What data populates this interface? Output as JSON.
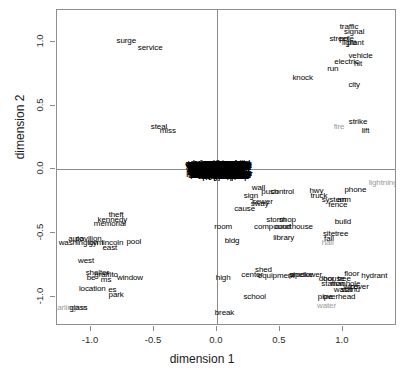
{
  "chart_data": {
    "type": "scatter",
    "title": "",
    "xlabel": "dimension 1",
    "ylabel": "dimension 2",
    "xlim": [
      -1.27,
      1.43
    ],
    "ylim": [
      -1.23,
      1.25
    ],
    "xticks": [
      -1.0,
      -0.5,
      0.0,
      0.5,
      1.0
    ],
    "xticklabels": [
      "-1.0",
      "-0.5",
      "0.0",
      "0.5",
      "1.0"
    ],
    "yticks": [
      1.0,
      0.5,
      0.0,
      -0.5,
      -1.0
    ],
    "yticklabels": [
      "1.0",
      "0.5",
      "0.0",
      "-0.5",
      "-1.0"
    ],
    "grid": false,
    "legend": false,
    "marker": "text-label",
    "points": [
      {
        "label": "surge",
        "x": -0.72,
        "y": 1.01,
        "color": "black"
      },
      {
        "label": "service",
        "x": -0.53,
        "y": 0.95,
        "color": "black"
      },
      {
        "label": "steal",
        "x": -0.46,
        "y": 0.33,
        "color": "black"
      },
      {
        "label": "miss",
        "x": -0.39,
        "y": 0.3,
        "color": "black"
      },
      {
        "label": "traffic",
        "x": 1.05,
        "y": 1.12,
        "color": "black"
      },
      {
        "label": "signal",
        "x": 1.09,
        "y": 1.08,
        "color": "black"
      },
      {
        "label": "street",
        "x": 0.97,
        "y": 1.02,
        "color": "black"
      },
      {
        "label": "pole",
        "x": 1.03,
        "y": 1.02,
        "color": "black"
      },
      {
        "label": "light",
        "x": 1.05,
        "y": 0.99,
        "color": "black"
      },
      {
        "label": "plant",
        "x": 1.1,
        "y": 0.99,
        "color": "black"
      },
      {
        "label": "vehicle",
        "x": 1.14,
        "y": 0.89,
        "color": "black"
      },
      {
        "label": "electric",
        "x": 1.03,
        "y": 0.84,
        "color": "black"
      },
      {
        "label": "hit",
        "x": 1.12,
        "y": 0.83,
        "color": "black"
      },
      {
        "label": "run",
        "x": 0.92,
        "y": 0.79,
        "color": "black"
      },
      {
        "label": "knock",
        "x": 0.68,
        "y": 0.72,
        "color": "black"
      },
      {
        "label": "city",
        "x": 1.09,
        "y": 0.66,
        "color": "black"
      },
      {
        "label": "strike",
        "x": 1.12,
        "y": 0.37,
        "color": "black"
      },
      {
        "label": "fire",
        "x": 0.97,
        "y": 0.33,
        "color": "gray"
      },
      {
        "label": "lift",
        "x": 1.18,
        "y": 0.3,
        "color": "black"
      },
      {
        "label": "lightning",
        "x": 1.32,
        "y": -0.11,
        "color": "gray"
      },
      {
        "label": "phone",
        "x": 1.1,
        "y": -0.16,
        "color": "black"
      },
      {
        "label": "wall",
        "x": 0.33,
        "y": -0.15,
        "color": "black"
      },
      {
        "label": "push",
        "x": 0.42,
        "y": -0.18,
        "color": "black"
      },
      {
        "label": "control",
        "x": 0.52,
        "y": -0.18,
        "color": "black"
      },
      {
        "label": "hwy",
        "x": 0.79,
        "y": -0.17,
        "color": "black"
      },
      {
        "label": "truck",
        "x": 0.81,
        "y": -0.21,
        "color": "black"
      },
      {
        "label": "sign",
        "x": 0.27,
        "y": -0.21,
        "color": "black"
      },
      {
        "label": "system",
        "x": 0.93,
        "y": -0.24,
        "color": "black"
      },
      {
        "label": "arm",
        "x": 1.01,
        "y": -0.24,
        "color": "black"
      },
      {
        "label": "sewer",
        "x": 0.36,
        "y": -0.26,
        "color": "black"
      },
      {
        "label": "sway",
        "x": 0.34,
        "y": -0.27,
        "color": "black"
      },
      {
        "label": "fence",
        "x": 0.96,
        "y": -0.28,
        "color": "black"
      },
      {
        "label": "cause",
        "x": 0.22,
        "y": -0.31,
        "color": "black"
      },
      {
        "label": "storm",
        "x": 0.47,
        "y": -0.4,
        "color": "black"
      },
      {
        "label": "shop",
        "x": 0.56,
        "y": -0.4,
        "color": "black"
      },
      {
        "label": "build",
        "x": 1.0,
        "y": -0.41,
        "color": "black"
      },
      {
        "label": "room",
        "x": 0.05,
        "y": -0.45,
        "color": "black"
      },
      {
        "label": "compound",
        "x": 0.44,
        "y": -0.45,
        "color": "black"
      },
      {
        "label": "courthouse",
        "x": 0.61,
        "y": -0.45,
        "color": "black"
      },
      {
        "label": "site",
        "x": 0.89,
        "y": -0.51,
        "color": "black"
      },
      {
        "label": "tree",
        "x": 0.99,
        "y": -0.51,
        "color": "black"
      },
      {
        "label": "library",
        "x": 0.53,
        "y": -0.54,
        "color": "black"
      },
      {
        "label": "fall",
        "x": 0.89,
        "y": -0.55,
        "color": "black"
      },
      {
        "label": "bldg",
        "x": 0.12,
        "y": -0.56,
        "color": "black"
      },
      {
        "label": "hall",
        "x": 0.88,
        "y": -0.58,
        "color": "gray"
      },
      {
        "label": "theft",
        "x": -0.8,
        "y": -0.36,
        "color": "black"
      },
      {
        "label": "kennedy",
        "x": -0.83,
        "y": -0.4,
        "color": "black"
      },
      {
        "label": "memorial",
        "x": -0.85,
        "y": -0.43,
        "color": "black"
      },
      {
        "label": "auto",
        "x": -1.12,
        "y": -0.55,
        "color": "black"
      },
      {
        "label": "pavilion",
        "x": -1.02,
        "y": -0.55,
        "color": "black"
      },
      {
        "label": "washington",
        "x": -1.1,
        "y": -0.58,
        "color": "black"
      },
      {
        "label": "gym",
        "x": -0.96,
        "y": -0.58,
        "color": "black"
      },
      {
        "label": "lincoln",
        "x": -0.83,
        "y": -0.58,
        "color": "black"
      },
      {
        "label": "pool",
        "x": -0.66,
        "y": -0.57,
        "color": "black"
      },
      {
        "label": "east",
        "x": -0.85,
        "y": -0.62,
        "color": "black"
      },
      {
        "label": "west",
        "x": -1.04,
        "y": -0.72,
        "color": "black"
      },
      {
        "label": "shelter",
        "x": -0.95,
        "y": -0.81,
        "color": "black"
      },
      {
        "label": "be",
        "x": -1.0,
        "y": -0.85,
        "color": "black"
      },
      {
        "label": "graffito",
        "x": -0.88,
        "y": -0.83,
        "color": "black"
      },
      {
        "label": "ms",
        "x": -0.88,
        "y": -0.87,
        "color": "black"
      },
      {
        "label": "window",
        "x": -0.69,
        "y": -0.85,
        "color": "black"
      },
      {
        "label": "location",
        "x": -0.99,
        "y": -0.94,
        "color": "black"
      },
      {
        "label": "es",
        "x": -0.83,
        "y": -0.95,
        "color": "black"
      },
      {
        "label": "park",
        "x": -0.8,
        "y": -0.99,
        "color": "black"
      },
      {
        "label": "arlington",
        "x": -1.15,
        "y": -1.09,
        "color": "gray"
      },
      {
        "label": "glass",
        "x": -1.1,
        "y": -1.09,
        "color": "black"
      },
      {
        "label": "high",
        "x": 0.05,
        "y": -0.85,
        "color": "black"
      },
      {
        "label": "center",
        "x": 0.28,
        "y": -0.83,
        "color": "black"
      },
      {
        "label": "shed",
        "x": 0.37,
        "y": -0.79,
        "color": "black"
      },
      {
        "label": "equipment",
        "x": 0.47,
        "y": -0.84,
        "color": "black"
      },
      {
        "label": "pipe",
        "x": 0.63,
        "y": -0.83,
        "color": "black"
      },
      {
        "label": "smoke",
        "x": 0.67,
        "y": -0.83,
        "color": "black"
      },
      {
        "label": "tower",
        "x": 0.76,
        "y": -0.83,
        "color": "black"
      },
      {
        "label": "floor",
        "x": 1.07,
        "y": -0.82,
        "color": "black"
      },
      {
        "label": "hydrant",
        "x": 1.25,
        "y": -0.84,
        "color": "black"
      },
      {
        "label": "door",
        "x": 0.87,
        "y": -0.86,
        "color": "black"
      },
      {
        "label": "house",
        "x": 0.93,
        "y": -0.86,
        "color": "black"
      },
      {
        "label": "tree",
        "x": 1.01,
        "y": -0.86,
        "color": "black"
      },
      {
        "label": "station",
        "x": 0.92,
        "y": -0.9,
        "color": "black"
      },
      {
        "label": "manhole",
        "x": 1.02,
        "y": -0.9,
        "color": "black"
      },
      {
        "label": "wire",
        "x": 1.06,
        "y": -0.92,
        "color": "black"
      },
      {
        "label": "cover",
        "x": 1.13,
        "y": -0.92,
        "color": "black"
      },
      {
        "label": "wash",
        "x": 1.0,
        "y": -0.95,
        "color": "black"
      },
      {
        "label": "stand",
        "x": 1.06,
        "y": -0.95,
        "color": "black"
      },
      {
        "label": "school",
        "x": 0.3,
        "y": -1.0,
        "color": "black"
      },
      {
        "label": "pipe",
        "x": 0.86,
        "y": -1.0,
        "color": "black"
      },
      {
        "label": "overhead",
        "x": 0.97,
        "y": -1.0,
        "color": "black"
      },
      {
        "label": "water",
        "x": 0.87,
        "y": -1.07,
        "color": "gray"
      },
      {
        "label": "break",
        "x": 0.06,
        "y": -1.13,
        "color": "black"
      }
    ],
    "dense_cluster": {
      "description": "Solid mass of overlapping word labels at the origin",
      "x_range": [
        -0.19,
        0.22
      ],
      "y_range": [
        -0.06,
        0.05
      ],
      "approx_count": 420
    }
  }
}
